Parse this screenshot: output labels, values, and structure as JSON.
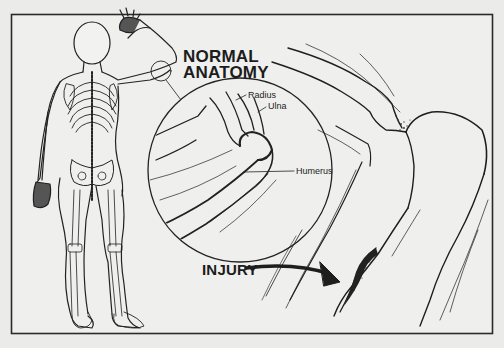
{
  "figure": {
    "type": "medical-illustration",
    "colors": {
      "background": "#ebebea",
      "ink": "#1c1c1c",
      "frame": "#2a2a2a"
    }
  },
  "headings": {
    "normal_line1": "NORMAL",
    "normal_line2": "ANATOMY",
    "injury": "INJURY"
  },
  "labels": {
    "radius": "Radius",
    "ulna": "Ulna",
    "humerus": "Humerus"
  }
}
